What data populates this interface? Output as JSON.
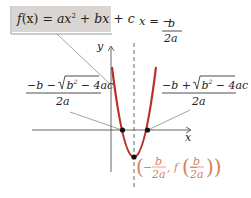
{
  "callout": {
    "f": "f",
    "x": "(x)",
    "eq": " = ",
    "ax": "ax",
    "sq": "2",
    "rest": " + bx + c",
    "full": "f(x) = ax² + bx + c"
  },
  "axes": {
    "x_label": "x",
    "y_label": "y"
  },
  "axis_of_symmetry": {
    "lhs": "x = −",
    "num": "b",
    "den": "2a"
  },
  "left_root": {
    "num_prefix": "−b − ",
    "radicand": "b",
    "radicand_sq": "2",
    "radicand_rest": " − 4ac",
    "den": "2a"
  },
  "right_root": {
    "num_prefix": "−b + ",
    "radicand": "b",
    "radicand_sq": "2",
    "radicand_rest": " − 4ac",
    "den": "2a"
  },
  "vertex": {
    "open": "(−",
    "num": "b",
    "den": "2a",
    "mid": ", f(−",
    "num2": "b",
    "den2": "2a",
    "close": "))"
  },
  "colors": {
    "parabola": "#b5322a",
    "vertex_label": "#d9805a",
    "callout_bg": "#d8d5d3",
    "axis": "#555555",
    "leader": "#888888",
    "text": "#222222"
  }
}
